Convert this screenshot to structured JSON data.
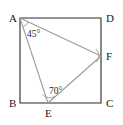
{
  "figure": {
    "shape_type": "square-with-inscribed-triangle",
    "background_color": "#ffffff",
    "square_stroke_color": "#2b2b2b",
    "triangle_stroke_color": "#9a9a9a",
    "label_color": "#1a1a1a",
    "vertices": [
      {
        "name": "A",
        "label": "A",
        "x": 20,
        "y": 18,
        "label_x": 9,
        "label_y": 22,
        "role": "square-corner-top-left"
      },
      {
        "name": "D",
        "label": "D",
        "x": 101,
        "y": 18,
        "label_x": 106,
        "label_y": 22,
        "role": "square-corner-top-right"
      },
      {
        "name": "B",
        "label": "B",
        "x": 20,
        "y": 103,
        "label_x": 9,
        "label_y": 107,
        "role": "square-corner-bottom-left"
      },
      {
        "name": "C",
        "label": "C",
        "x": 101,
        "y": 103,
        "label_x": 106,
        "label_y": 107,
        "role": "square-corner-bottom-right"
      },
      {
        "name": "E",
        "label": "E",
        "x": 48,
        "y": 103,
        "label_x": 45,
        "label_y": 117,
        "role": "point-on-side-BC"
      },
      {
        "name": "F",
        "label": "F",
        "x": 101,
        "y": 56,
        "label_x": 106,
        "label_y": 60,
        "role": "point-on-side-DC"
      }
    ],
    "square_path": "M 20 18 L 101 18 L 101 103 L 20 103 Z",
    "triangle_segments": [
      {
        "name": "segment-AF",
        "from": "A",
        "to": "F",
        "x1": 20,
        "y1": 18,
        "x2": 101,
        "y2": 56
      },
      {
        "name": "segment-AE",
        "from": "A",
        "to": "E",
        "x1": 20,
        "y1": 18,
        "x2": 48,
        "y2": 103
      },
      {
        "name": "segment-EF",
        "from": "E",
        "to": "F",
        "x1": 48,
        "y1": 103,
        "x2": 101,
        "y2": 56
      }
    ],
    "angles": [
      {
        "name": "angle-at-A",
        "vertex": "A",
        "value": "45",
        "text": "45°",
        "label_x": 27,
        "label_y": 37,
        "arc_path": "M 28.5 21.9 A 9 9 0 0 1 22.8 26.6"
      },
      {
        "name": "angle-at-E",
        "vertex": "E",
        "value": "70",
        "text": "70°",
        "label_x": 49,
        "label_y": 94,
        "arc_path": "M 42.4 94.6 A 10 10 0 0 0 55.1 96.2"
      },
      {
        "name": "angle-at-F",
        "vertex": "F",
        "value": "",
        "text": "",
        "label_x": 0,
        "label_y": 0,
        "arc_path": "M 95.7 49.1 A 8.5 8.5 0 0 1 96.2 62.1"
      }
    ]
  }
}
